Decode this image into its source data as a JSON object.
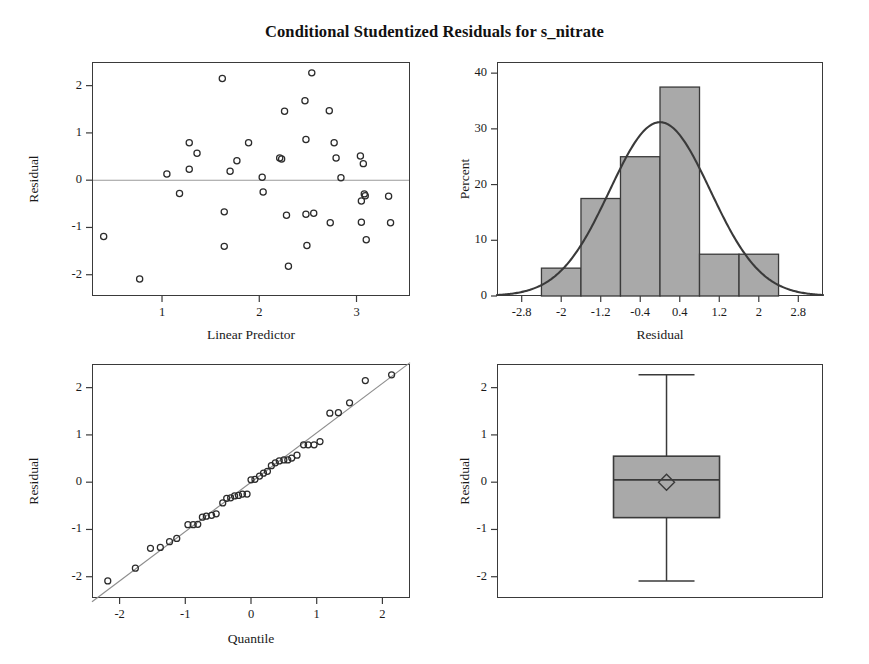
{
  "title": "Conditional Studentized Residuals for s_nitrate",
  "colors": {
    "axis": "#3a3a3a",
    "text": "#1a1a1a",
    "marker_stroke": "#2b2b2b",
    "bar_fill": "#a9a9a9",
    "bar_stroke": "#3a3a3a",
    "curve": "#3a3a3a",
    "reference_line": "#9a9a9a",
    "box_fill": "#a9a9a9"
  },
  "panels": {
    "residual_vs_predictor": {
      "name": "Residual by Linear Predictor",
      "xlabel": "Linear Predictor",
      "ylabel": "Residual",
      "xticks": [
        1,
        2,
        3
      ],
      "yticks": [
        2,
        1,
        0,
        -1,
        -2
      ],
      "xlim": [
        0.28,
        3.55
      ],
      "ylim": [
        -2.45,
        2.5
      ],
      "reference_y": 0
    },
    "histogram": {
      "name": "Residual Histogram",
      "xlabel": "Residual",
      "ylabel": "Percent",
      "xticks": [
        -2.8,
        -2,
        -1.2,
        -0.4,
        0.4,
        1.2,
        2,
        2.8
      ],
      "xticklabels": [
        "-2.8",
        "-2",
        "-1.2",
        "-0.4",
        "0.4",
        "1.2",
        "2",
        "2.8"
      ],
      "yticks": [
        0,
        10,
        20,
        30,
        40
      ],
      "xlim": [
        -3.3,
        3.3
      ],
      "ylim": [
        0,
        42
      ]
    },
    "qq": {
      "name": "Residual Q-Q Plot",
      "xlabel": "Quantile",
      "ylabel": "Residual",
      "xticks": [
        -2,
        -1,
        0,
        1,
        2
      ],
      "yticks": [
        2,
        1,
        0,
        -1,
        -2
      ],
      "xlim": [
        -2.42,
        2.42
      ],
      "ylim": [
        -2.45,
        2.5
      ]
    },
    "boxplot": {
      "name": "Residual Box Plot",
      "ylabel": "Residual",
      "yticks": [
        2,
        1,
        0,
        -1,
        -2
      ],
      "ylim": [
        -2.45,
        2.5
      ]
    }
  },
  "chart_data": [
    {
      "type": "scatter",
      "name": "Residual vs Linear Predictor",
      "title": "Conditional Studentized Residuals for s_nitrate",
      "xlabel": "Linear Predictor",
      "ylabel": "Residual",
      "xlim": [
        0.28,
        3.55
      ],
      "ylim": [
        -2.45,
        2.5
      ],
      "xticks": [
        1,
        2,
        3
      ],
      "yticks": [
        -2,
        -1,
        0,
        1,
        2
      ],
      "grid": false,
      "reference_line_y": 0,
      "points": [
        [
          0.4,
          -1.19
        ],
        [
          0.77,
          -2.09
        ],
        [
          1.05,
          0.13
        ],
        [
          1.18,
          -0.28
        ],
        [
          1.28,
          0.79
        ],
        [
          1.28,
          0.23
        ],
        [
          1.36,
          0.57
        ],
        [
          1.62,
          2.15
        ],
        [
          1.64,
          -0.67
        ],
        [
          1.64,
          -1.4
        ],
        [
          1.7,
          0.19
        ],
        [
          1.77,
          0.41
        ],
        [
          1.89,
          0.79
        ],
        [
          2.03,
          0.06
        ],
        [
          2.04,
          -0.25
        ],
        [
          2.21,
          0.47
        ],
        [
          2.23,
          0.45
        ],
        [
          2.26,
          1.46
        ],
        [
          2.28,
          -0.74
        ],
        [
          2.3,
          -1.82
        ],
        [
          2.47,
          1.68
        ],
        [
          2.48,
          0.86
        ],
        [
          2.48,
          -0.72
        ],
        [
          2.49,
          -1.38
        ],
        [
          2.54,
          2.27
        ],
        [
          2.56,
          -0.7
        ],
        [
          2.72,
          1.47
        ],
        [
          2.73,
          -0.9
        ],
        [
          2.77,
          0.79
        ],
        [
          2.79,
          0.47
        ],
        [
          2.84,
          0.05
        ],
        [
          3.04,
          0.51
        ],
        [
          3.05,
          -0.44
        ],
        [
          3.05,
          -0.89
        ],
        [
          3.07,
          0.35
        ],
        [
          3.08,
          -0.29
        ],
        [
          3.09,
          -0.33
        ],
        [
          3.1,
          -1.26
        ],
        [
          3.33,
          -0.34
        ],
        [
          3.35,
          -0.9
        ]
      ]
    },
    {
      "type": "bar",
      "name": "Histogram of Residuals with Normal Curve",
      "xlabel": "Residual",
      "ylabel": "Percent",
      "xlim": [
        -3.3,
        3.3
      ],
      "ylim": [
        0,
        42
      ],
      "yticks": [
        0,
        10,
        20,
        30,
        40
      ],
      "xticks": [
        -2.8,
        -2,
        -1.2,
        -0.4,
        0.4,
        1.2,
        2,
        2.8
      ],
      "grid": false,
      "bin_edges": [
        -2.4,
        -1.6,
        -0.8,
        0.0,
        0.8,
        1.6,
        2.4
      ],
      "categories": [
        "-2.4 to -1.6",
        "-1.6 to -0.8",
        "-0.8 to 0.0",
        "0.0 to 0.8",
        "0.8 to 1.6",
        "1.6 to 2.4"
      ],
      "values": [
        5.0,
        17.5,
        25.0,
        37.5,
        7.5,
        7.5
      ],
      "overlay": {
        "type": "normal_curve",
        "mean": 0.0,
        "sd": 1.02,
        "peak_percent": 31.2
      }
    },
    {
      "type": "scatter",
      "name": "Normal Quantile-Quantile Plot of Residuals",
      "xlabel": "Quantile",
      "ylabel": "Residual",
      "xlim": [
        -2.42,
        2.42
      ],
      "ylim": [
        -2.45,
        2.5
      ],
      "xticks": [
        -2,
        -1,
        0,
        1,
        2
      ],
      "yticks": [
        -2,
        -1,
        0,
        1,
        2
      ],
      "grid": false,
      "reference_line": {
        "intercept": 0.0,
        "slope": 1.045
      },
      "points": [
        [
          -2.18,
          -2.09
        ],
        [
          -1.76,
          -1.82
        ],
        [
          -1.53,
          -1.4
        ],
        [
          -1.38,
          -1.38
        ],
        [
          -1.24,
          -1.26
        ],
        [
          -1.13,
          -1.19
        ],
        [
          -0.96,
          -0.9
        ],
        [
          -0.88,
          -0.9
        ],
        [
          -0.81,
          -0.89
        ],
        [
          -0.74,
          -0.74
        ],
        [
          -0.68,
          -0.72
        ],
        [
          -0.6,
          -0.7
        ],
        [
          -0.53,
          -0.67
        ],
        [
          -0.43,
          -0.44
        ],
        [
          -0.37,
          -0.34
        ],
        [
          -0.31,
          -0.33
        ],
        [
          -0.25,
          -0.29
        ],
        [
          -0.19,
          -0.28
        ],
        [
          -0.13,
          -0.25
        ],
        [
          -0.06,
          -0.25
        ],
        [
          0.0,
          0.05
        ],
        [
          0.06,
          0.06
        ],
        [
          0.13,
          0.13
        ],
        [
          0.19,
          0.19
        ],
        [
          0.25,
          0.23
        ],
        [
          0.31,
          0.35
        ],
        [
          0.37,
          0.41
        ],
        [
          0.43,
          0.45
        ],
        [
          0.5,
          0.47
        ],
        [
          0.56,
          0.47
        ],
        [
          0.62,
          0.51
        ],
        [
          0.7,
          0.57
        ],
        [
          0.8,
          0.79
        ],
        [
          0.87,
          0.79
        ],
        [
          0.96,
          0.79
        ],
        [
          1.05,
          0.86
        ],
        [
          1.2,
          1.46
        ],
        [
          1.33,
          1.47
        ],
        [
          1.5,
          1.68
        ],
        [
          1.74,
          2.15
        ],
        [
          2.14,
          2.27
        ]
      ]
    },
    {
      "type": "box",
      "name": "Box Plot of Residuals",
      "ylabel": "Residual",
      "ylim": [
        -2.45,
        2.5
      ],
      "yticks": [
        -2,
        -1,
        0,
        1,
        2
      ],
      "grid": false,
      "stats": {
        "whisker_low": -2.09,
        "q1": -0.75,
        "median": 0.05,
        "q3": 0.55,
        "whisker_high": 2.27,
        "mean": 0.0
      }
    }
  ]
}
